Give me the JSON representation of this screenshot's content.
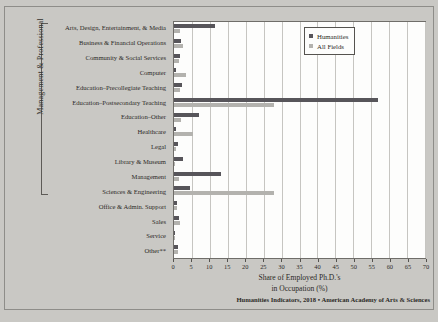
{
  "chart_data": {
    "type": "bar",
    "orientation": "horizontal",
    "title": "",
    "xlabel_line1": "Share of Employed Ph.D.'s",
    "xlabel_line2": "in Occupation (%)",
    "ylabel": "",
    "xlim": [
      0,
      70
    ],
    "xticks": [
      0,
      5,
      10,
      15,
      20,
      25,
      30,
      35,
      40,
      45,
      50,
      55,
      60,
      65,
      70
    ],
    "grid": "vertical",
    "legend_position": "top-right",
    "group_bracket_label": "Management & Professional",
    "group_bracket_range": [
      0,
      11
    ],
    "categories": [
      "Arts, Design, Entertainment, & Media",
      "Business & Financial Operations",
      "Community & Social Services",
      "Computer",
      "Education–Precollegiate Teaching",
      "Education–Postsecondary Teaching",
      "Education–Other",
      "Healthcare",
      "Legal",
      "Library & Museum",
      "Management",
      "Sciences & Engineering",
      "Office & Admin. Support",
      "Sales",
      "Service",
      "Other**"
    ],
    "series": [
      {
        "name": "Humanities",
        "color": "#57555a",
        "values": [
          11.4,
          2.0,
          1.8,
          0.5,
          2.2,
          57.0,
          7.0,
          0.5,
          1.2,
          2.6,
          13.0,
          4.5,
          0.7,
          1.5,
          0.3,
          1.0
        ]
      },
      {
        "name": "All Fields",
        "color": "#b3b2ae",
        "values": [
          1.8,
          2.6,
          1.4,
          3.4,
          1.6,
          28.0,
          2.0,
          5.2,
          0.5,
          0.4,
          1.5,
          28.0,
          0.8,
          1.6,
          0.2,
          1.2
        ]
      }
    ],
    "source_note": "Humanities Indicators, 2018 • American Academy of Arts & Sciences"
  }
}
